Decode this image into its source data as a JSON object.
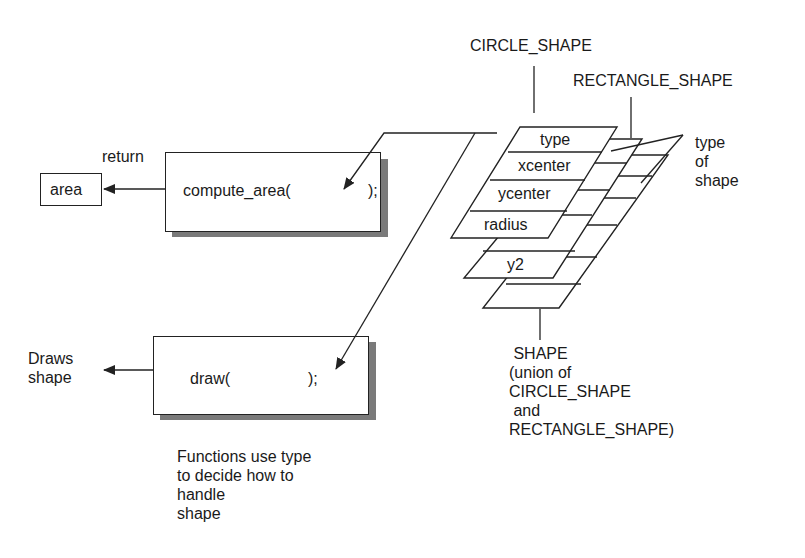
{
  "diagram": {
    "labels": {
      "circle_shape": "CIRCLE_SHAPE",
      "rectangle_shape": "RECTANGLE_SHAPE",
      "type_of_shape": "type\nof\nshape",
      "return": "return",
      "area": "area",
      "draws_shape": "Draws\nshape",
      "shape_union": " SHAPE\n(union of\nCIRCLE_SHAPE\n and\nRECTANGLE_SHAPE)",
      "functions_note": "Functions use type\nto decide how to\nhandle\nshape"
    },
    "functions": {
      "compute_area": {
        "name": "compute_area(",
        "close": ");"
      },
      "draw": {
        "name": "draw(",
        "close": ");"
      }
    },
    "records": {
      "circle_fields": [
        "type",
        "xcenter",
        "ycenter",
        "radius"
      ],
      "rectangle_visible_fields": [
        "y2"
      ]
    },
    "colors": {
      "line": "#222222",
      "shadow": "#7a7a7a",
      "background": "#ffffff"
    }
  }
}
